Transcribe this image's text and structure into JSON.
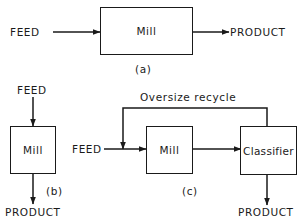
{
  "diagram": {
    "a": {
      "feed": "FEED",
      "unit": "Mill",
      "product": "PRODUCT",
      "caption": "(a)"
    },
    "b": {
      "feed": "FEED",
      "unit": "Mill",
      "product": "PRODUCT",
      "caption": "(b)"
    },
    "c": {
      "feed": "FEED",
      "unit": "Mill",
      "classifier": "Classifier",
      "recycle": "Oversize recycle",
      "product": "PRODUCT",
      "caption": "(c)"
    }
  },
  "colors": {
    "line": "#1a1a1a",
    "background": "#ffffff"
  }
}
